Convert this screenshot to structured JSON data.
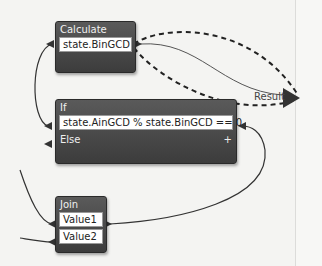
{
  "nodes": {
    "calculate": {
      "title": "Calculate",
      "output": "state.BinGCD"
    },
    "if": {
      "title": "If",
      "condition": "state.AinGCD % state.BinGCD == 0",
      "else_label": "Else",
      "add_icon": "+"
    },
    "join": {
      "title": "Join",
      "inputs": [
        "Value1",
        "Value2"
      ]
    }
  },
  "result": {
    "label": "Result"
  },
  "colors": {
    "node_bg": "#4a4a4a",
    "wire": "#333333",
    "slot_bg": "#ffffff",
    "canvas": "#f4f4f2"
  }
}
